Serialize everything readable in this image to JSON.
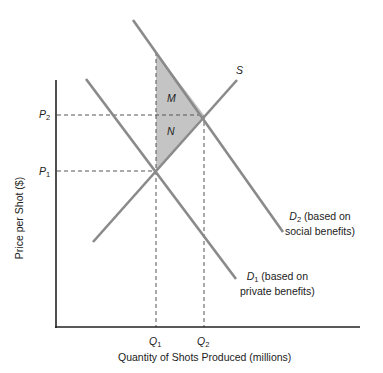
{
  "diagram": {
    "axes": {
      "y_label": "Price per Shot ($)",
      "x_label": "Quantity of Shots Produced (millions)",
      "y_ticks": [
        {
          "base": "P",
          "sub": "2"
        },
        {
          "base": "P",
          "sub": "1"
        }
      ],
      "x_ticks": [
        {
          "base": "Q",
          "sub": "1"
        },
        {
          "base": "Q",
          "sub": "2"
        }
      ]
    },
    "curves": {
      "supply": {
        "label": "S"
      },
      "d2": {
        "base": "D",
        "sub": "2",
        "desc_line1": " (based on",
        "desc_line2": "social benefits)"
      },
      "d1": {
        "base": "D",
        "sub": "1",
        "desc_line1": " (based on",
        "desc_line2": "private benefits)"
      }
    },
    "regions": {
      "upper": "M",
      "lower": "N"
    },
    "colors": {
      "curve": "#8a8a8a",
      "axis": "#222222",
      "shade": "#c4c4c4",
      "dash": "#555555"
    }
  }
}
